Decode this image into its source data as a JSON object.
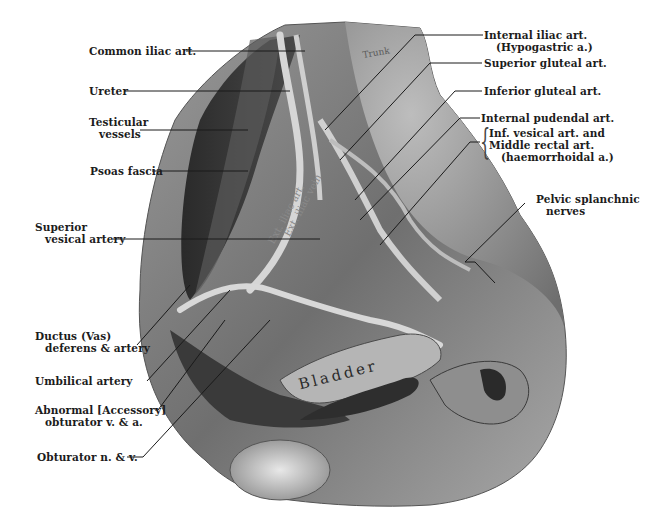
{
  "figure": {
    "background_color": "#ffffff",
    "tissue_colors": {
      "light": "#c9c9c9",
      "mid": "#8a8a8a",
      "dark": "#2e2e2e",
      "vessel": "#d8d8d8"
    }
  },
  "labels_left": [
    {
      "id": "common-iliac-art",
      "lines": [
        "Common iliac art."
      ]
    },
    {
      "id": "ureter",
      "lines": [
        "Ureter"
      ]
    },
    {
      "id": "testicular-vessels",
      "lines": [
        "Testicular",
        "vessels"
      ]
    },
    {
      "id": "psoas-fascia",
      "lines": [
        "Psoas fascia"
      ]
    },
    {
      "id": "superior-vesical-artery",
      "lines": [
        "Superior",
        "vesical artery"
      ]
    },
    {
      "id": "ductus-deferens",
      "lines": [
        "Ductus (Vas)",
        "deferens & artery"
      ]
    },
    {
      "id": "umbilical-artery",
      "lines": [
        "Umbilical artery"
      ]
    },
    {
      "id": "abnormal-obturator",
      "lines": [
        "Abnormal [Accessory]",
        "obturator v. & a."
      ]
    },
    {
      "id": "obturator-n-v",
      "lines": [
        "Obturator n. & v."
      ]
    }
  ],
  "labels_right": [
    {
      "id": "internal-iliac-art",
      "lines": [
        "Internal iliac art.",
        "(Hypogastric a.)"
      ]
    },
    {
      "id": "superior-gluteal-art",
      "lines": [
        "Superior gluteal art."
      ]
    },
    {
      "id": "inferior-gluteal-art",
      "lines": [
        "Inferior gluteal art."
      ]
    },
    {
      "id": "internal-pudendal-art",
      "lines": [
        "Internal pudendal art."
      ]
    },
    {
      "id": "inf-vesical-middle-rectal",
      "lines": [
        "Inf. vesical art. and",
        "Middle rectal art.",
        "(haemorrhoidal a.)"
      ]
    },
    {
      "id": "pelvic-splanchnic-nerves",
      "lines": [
        "Pelvic splanchnic",
        "nerves"
      ]
    }
  ],
  "in_image_text": {
    "bladder": "Bladder",
    "ext_iliac_vein": "Ext. iliac vein",
    "ext_iliac_art": "Ext. iliac art.",
    "trunk": "Trunk"
  }
}
